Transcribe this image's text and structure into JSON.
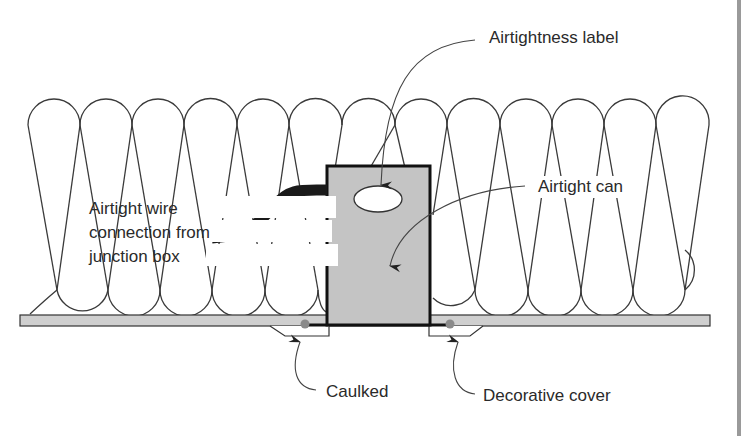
{
  "figure": {
    "labels": {
      "airtightness_label": "Airtightness label",
      "airtight_can": "Airtight can",
      "wire_connection": "Airtight wire connection from junction box",
      "caulked": "Caulked",
      "decorative_cover": "Decorative cover"
    },
    "components": [
      {
        "name": "insulation-batts",
        "description": "Loose-fill / batt insulation loops above ceiling"
      },
      {
        "name": "ceiling-board",
        "description": "Drywall ceiling plane"
      },
      {
        "name": "airtight-can",
        "description": "Recessed light housing"
      },
      {
        "name": "airtightness-label",
        "description": "Oval label on can"
      },
      {
        "name": "wire",
        "description": "Wire from junction box"
      },
      {
        "name": "caulk-beads",
        "description": "Caulk at can/ceiling joint"
      },
      {
        "name": "decorative-cover",
        "description": "Trim ring below ceiling"
      }
    ],
    "colors": {
      "line": "#333333",
      "can_fill": "#c8c8c8",
      "board_fill": "#cfcfcf",
      "caulk": "#8a8a8a",
      "wire": "#1a1a1a"
    }
  }
}
